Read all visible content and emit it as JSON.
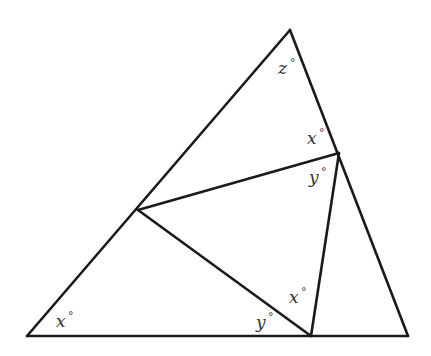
{
  "diagram": {
    "type": "geometry",
    "vertices": {
      "top": [
        290,
        30
      ],
      "bottom_left": [
        27,
        336
      ],
      "bottom_right": [
        408,
        336
      ],
      "inner_right": [
        339,
        153
      ],
      "inner_left": [
        138,
        210
      ],
      "inner_bottom": [
        311,
        336
      ]
    },
    "angle_labels": [
      {
        "id": "z-top",
        "var": "z",
        "deg": "°",
        "x": 278,
        "y": 74
      },
      {
        "id": "x-right-upper",
        "var": "x",
        "deg": "°",
        "x": 307,
        "y": 144
      },
      {
        "id": "y-right-lower",
        "var": "y",
        "deg": "°",
        "x": 309,
        "y": 183
      },
      {
        "id": "x-bottom-upper",
        "var": "x",
        "deg": "°",
        "x": 289,
        "y": 303
      },
      {
        "id": "y-bottom-left",
        "var": "y",
        "deg": "°",
        "x": 256,
        "y": 328
      },
      {
        "id": "x-bottom-left-corner",
        "var": "x",
        "deg": "°",
        "x": 56,
        "y": 327
      }
    ],
    "colors": {
      "line": "#1a1a1a",
      "text": "#333333",
      "background": "#ffffff"
    }
  }
}
